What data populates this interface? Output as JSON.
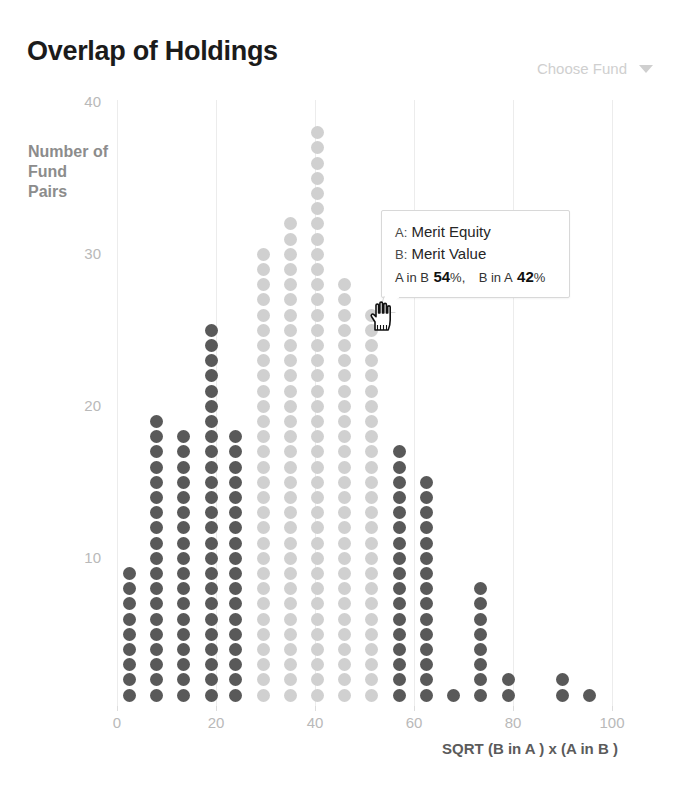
{
  "header": {
    "title": "Overlap of Holdings",
    "fund_selector": {
      "label": "Choose Fund",
      "caret_icon": "chevron-down-icon"
    }
  },
  "tooltip": {
    "a_key": "A:",
    "a_value": "Merit Equity",
    "b_key": "B:",
    "b_value": "Merit Value",
    "a_in_b_label": "A in B",
    "a_in_b_value": "54",
    "a_in_b_unit": "%,",
    "b_in_a_label": "B in A",
    "b_in_a_value": "42",
    "b_in_a_unit": "%"
  },
  "cursor": {
    "icon": "pointing-hand-cursor"
  },
  "colors": {
    "dark_dot": "#595959",
    "light_dot": "#d0d0d0",
    "gridline": "#ececec",
    "axis_text": "#b9b9b9",
    "title": "#1b1b1b",
    "ylabel": "#8c8c8c",
    "xlabel": "#5b5b5b",
    "selector_text": "#cfcfcf"
  },
  "chart_data": {
    "type": "scatter",
    "title": "Overlap of Holdings",
    "xlabel": "SQRT (B in A ) x (A in B )",
    "ylabel": "Number of Fund Pairs",
    "xlim": [
      0,
      100
    ],
    "ylim": [
      0,
      40
    ],
    "xticks": [
      0,
      20,
      40,
      60,
      80,
      100
    ],
    "yticks": [
      10,
      20,
      30,
      40
    ],
    "grid": "vertical",
    "legend": "none",
    "note": "Dot plot / histogram: each dot is one fund pair; column height = count.",
    "categories": [
      2.5,
      8,
      13.5,
      19,
      24,
      29.5,
      35,
      40.5,
      46,
      51.5,
      57,
      62.5,
      68,
      73.5,
      79,
      84.5,
      90,
      95.5
    ],
    "values": [
      9,
      19,
      18,
      25,
      18,
      30,
      32,
      38,
      28,
      26,
      17,
      15,
      1,
      8,
      2,
      0,
      2,
      1
    ],
    "series": [
      {
        "name": "Dot column counts",
        "points": [
          {
            "x": 2.5,
            "count": 9,
            "shade": "dark"
          },
          {
            "x": 8.0,
            "count": 19,
            "shade": "dark"
          },
          {
            "x": 13.5,
            "count": 18,
            "shade": "dark"
          },
          {
            "x": 19.0,
            "count": 25,
            "shade": "dark"
          },
          {
            "x": 24.0,
            "count": 18,
            "shade": "dark"
          },
          {
            "x": 29.5,
            "count": 30,
            "shade": "light"
          },
          {
            "x": 35.0,
            "count": 32,
            "shade": "light"
          },
          {
            "x": 40.5,
            "count": 38,
            "shade": "light"
          },
          {
            "x": 46.0,
            "count": 28,
            "shade": "light"
          },
          {
            "x": 51.5,
            "count": 26,
            "shade": "light"
          },
          {
            "x": 57.0,
            "count": 17,
            "shade": "dark"
          },
          {
            "x": 62.5,
            "count": 15,
            "shade": "dark"
          },
          {
            "x": 68.0,
            "count": 1,
            "shade": "dark"
          },
          {
            "x": 73.5,
            "count": 8,
            "shade": "dark"
          },
          {
            "x": 79.0,
            "count": 2,
            "shade": "dark"
          },
          {
            "x": 90.0,
            "count": 2,
            "shade": "dark"
          },
          {
            "x": 95.5,
            "count": 1,
            "shade": "dark"
          }
        ]
      }
    ]
  }
}
